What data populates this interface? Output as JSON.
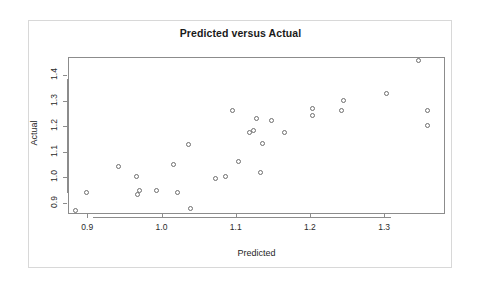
{
  "chart_data": {
    "type": "scatter",
    "title": "Predicted versus Actual",
    "xlabel": "Predicted",
    "ylabel": "Actual",
    "xlim": [
      0.874,
      1.382
    ],
    "ylim": [
      0.855,
      1.472
    ],
    "xticks": [
      0.9,
      1.0,
      1.1,
      1.2,
      1.3
    ],
    "xtick_labels": [
      "0.9",
      "1.0",
      "1.1",
      "1.2",
      "1.3"
    ],
    "yticks": [
      0.9,
      1.0,
      1.1,
      1.2,
      1.3,
      1.4
    ],
    "ytick_labels": [
      "0.9",
      "1.0",
      "1.1",
      "1.2",
      "1.3",
      "1.4"
    ],
    "grid": false,
    "legend": null,
    "marker": "open-circle",
    "marker_color": "#6e6e6e",
    "points": [
      {
        "x": 0.884,
        "y": 0.868
      },
      {
        "x": 0.899,
        "y": 0.939
      },
      {
        "x": 0.942,
        "y": 1.04
      },
      {
        "x": 0.966,
        "y": 1.001
      },
      {
        "x": 0.967,
        "y": 0.93
      },
      {
        "x": 0.97,
        "y": 0.947
      },
      {
        "x": 0.993,
        "y": 0.947
      },
      {
        "x": 1.016,
        "y": 1.05
      },
      {
        "x": 1.022,
        "y": 0.938
      },
      {
        "x": 1.036,
        "y": 1.13
      },
      {
        "x": 1.039,
        "y": 0.876
      },
      {
        "x": 1.073,
        "y": 0.994
      },
      {
        "x": 1.086,
        "y": 1.003
      },
      {
        "x": 1.095,
        "y": 1.262
      },
      {
        "x": 1.104,
        "y": 1.062
      },
      {
        "x": 1.118,
        "y": 1.176
      },
      {
        "x": 1.124,
        "y": 1.183
      },
      {
        "x": 1.128,
        "y": 1.232
      },
      {
        "x": 1.134,
        "y": 1.02
      },
      {
        "x": 1.136,
        "y": 1.133
      },
      {
        "x": 1.148,
        "y": 1.222
      },
      {
        "x": 1.166,
        "y": 1.175
      },
      {
        "x": 1.203,
        "y": 1.242
      },
      {
        "x": 1.204,
        "y": 1.268
      },
      {
        "x": 1.242,
        "y": 1.262
      },
      {
        "x": 1.245,
        "y": 1.303
      },
      {
        "x": 1.303,
        "y": 1.33
      },
      {
        "x": 1.346,
        "y": 1.46
      },
      {
        "x": 1.358,
        "y": 1.262
      },
      {
        "x": 1.358,
        "y": 1.203
      }
    ]
  }
}
